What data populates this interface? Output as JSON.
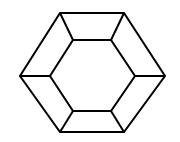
{
  "diagram": {
    "stroke_color": "#000000",
    "background": "#ffffff",
    "stroke_width": 2,
    "outer_hexagon": [
      [
        60,
        13
      ],
      [
        124,
        13
      ],
      [
        165,
        76
      ],
      [
        124,
        132
      ],
      [
        60,
        132
      ],
      [
        20,
        76
      ]
    ],
    "inner_hexagon": [
      [
        73,
        40
      ],
      [
        111,
        40
      ],
      [
        135,
        76
      ],
      [
        111,
        111
      ],
      [
        73,
        111
      ],
      [
        50,
        76
      ]
    ]
  }
}
